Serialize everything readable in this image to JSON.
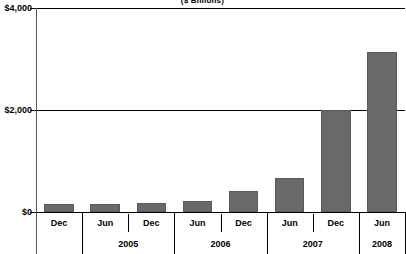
{
  "chart_data": {
    "type": "bar",
    "title": "",
    "subtitle": "($ Billions)",
    "xlabel": "",
    "ylabel": "",
    "ylim": [
      0,
      4000
    ],
    "yticks": [
      0,
      2000,
      4000
    ],
    "ytick_labels": [
      "$0",
      "$2,000",
      "$4,000"
    ],
    "grid": true,
    "legend": "none",
    "bar_color": "#696969",
    "categories": [
      "Dec",
      "Jun",
      "Dec",
      "Jun",
      "Dec",
      "Jun",
      "Dec",
      "Jun"
    ],
    "values": [
      160,
      160,
      180,
      220,
      410,
      670,
      2000,
      3140
    ],
    "year_groups": [
      {
        "label": "2004",
        "span": 1,
        "visible": false
      },
      {
        "label": "2005",
        "span": 2,
        "visible": true
      },
      {
        "label": "2006",
        "span": 2,
        "visible": true
      },
      {
        "label": "2007",
        "span": 2,
        "visible": true
      },
      {
        "label": "2008",
        "span": 1,
        "visible": true
      }
    ],
    "points": [
      {
        "period": "Dec",
        "year": "2004",
        "value": 160
      },
      {
        "period": "Jun",
        "year": "2005",
        "value": 160
      },
      {
        "period": "Dec",
        "year": "2005",
        "value": 180
      },
      {
        "period": "Jun",
        "year": "2006",
        "value": 220
      },
      {
        "period": "Dec",
        "year": "2006",
        "value": 410
      },
      {
        "period": "Jun",
        "year": "2007",
        "value": 670
      },
      {
        "period": "Dec",
        "year": "2007",
        "value": 2000
      },
      {
        "period": "Jun",
        "year": "2008",
        "value": 3140
      }
    ]
  },
  "axis": {
    "y_labels": [
      {
        "text": "$4,000",
        "value": 4000
      },
      {
        "text": "$2,000",
        "value": 2000
      },
      {
        "text": "$0",
        "value": 0
      }
    ],
    "year_labels": [
      "2005",
      "2006",
      "2007",
      "2008"
    ]
  }
}
